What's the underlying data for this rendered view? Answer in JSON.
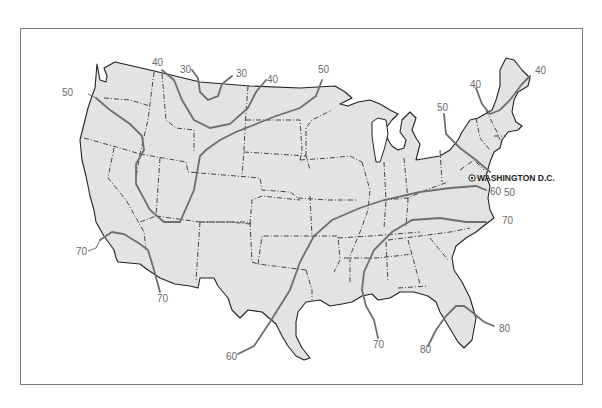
{
  "map": {
    "subject": "Contiguous United States isotherm map",
    "frame_color": "#7a7a7a",
    "land_color": "#e3e3e3",
    "isotherm_color": "#6e6e6e",
    "city": {
      "label": "WASHINGTON D.C.",
      "marker": "capital-star-circle"
    },
    "isotherm_labels": [
      {
        "id": "iso-40-nw",
        "value": "40",
        "x": 42,
        "y": 66
      },
      {
        "id": "iso-30-a",
        "value": "30",
        "x": 182,
        "y": 73
      },
      {
        "id": "iso-30-b",
        "value": "30",
        "x": 236,
        "y": 77
      },
      {
        "id": "iso-40-mt",
        "value": "40",
        "x": 267,
        "y": 82
      },
      {
        "id": "iso-50-w",
        "value": "50",
        "x": 63,
        "y": 95
      },
      {
        "id": "iso-50-n",
        "value": "50",
        "x": 323,
        "y": 73
      },
      {
        "id": "iso-40-ne1",
        "value": "40",
        "x": 470,
        "y": 87
      },
      {
        "id": "iso-40-ne2",
        "value": "40",
        "x": 535,
        "y": 73
      },
      {
        "id": "iso-50-ne",
        "value": "50",
        "x": 437,
        "y": 110
      },
      {
        "id": "iso-60-dc",
        "value": "60",
        "x": 490,
        "y": 195
      },
      {
        "id": "iso-50-dc",
        "value": "50",
        "x": 504,
        "y": 196
      },
      {
        "id": "iso-70-nc",
        "value": "70",
        "x": 500,
        "y": 223
      },
      {
        "id": "iso-70-ca",
        "value": "70",
        "x": 77,
        "y": 254
      },
      {
        "id": "iso-70-az",
        "value": "70",
        "x": 157,
        "y": 301
      },
      {
        "id": "iso-60-tx",
        "value": "60",
        "x": 227,
        "y": 359
      },
      {
        "id": "iso-70-la",
        "value": "70",
        "x": 373,
        "y": 348
      },
      {
        "id": "iso-80-fl1",
        "value": "80",
        "x": 420,
        "y": 353
      },
      {
        "id": "iso-80-fl2",
        "value": "80",
        "x": 499,
        "y": 331
      }
    ]
  }
}
